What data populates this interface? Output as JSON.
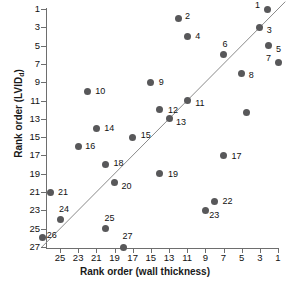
{
  "chart_data": {
    "type": "scatter",
    "title": "",
    "xlabel": "Rank order (wall thickness)",
    "ylabel_text": "Rank order (LVID",
    "ylabel_sub": "d",
    "ylabel_tail": ")",
    "xlim": [
      27,
      0
    ],
    "ylim": [
      0,
      27
    ],
    "x_ticks": [
      25,
      23,
      21,
      19,
      17,
      15,
      13,
      11,
      9,
      7,
      5,
      3,
      1
    ],
    "y_ticks": [
      1,
      3,
      5,
      7,
      9,
      11,
      13,
      15,
      17,
      19,
      21,
      23,
      25,
      27
    ],
    "x_axis_reversed": true,
    "y_axis_reversed": true,
    "grid": false,
    "legend": "none",
    "marker_color": "#58585a",
    "axis_color": "#6e6e6e",
    "fit_line": {
      "label": "identity-line",
      "x_start": 27,
      "y_start": 27,
      "x_end": 0.2,
      "y_end": 0.2,
      "color": "#8a8a8a"
    },
    "points": [
      {
        "label": "1",
        "x": 2.2,
        "y": 1.0,
        "lx": -12,
        "ly": -4
      },
      {
        "label": "2",
        "x": 12.0,
        "y": 2.0,
        "lx": 7,
        "ly": -2
      },
      {
        "label": "3",
        "x": 3.0,
        "y": 3.0,
        "lx": 7,
        "ly": 3
      },
      {
        "label": "4",
        "x": 11.0,
        "y": 4.0,
        "lx": 8,
        "ly": 0
      },
      {
        "label": "5",
        "x": 2.0,
        "y": 5.0,
        "lx": 7,
        "ly": 3
      },
      {
        "label": "6",
        "x": 7.0,
        "y": 6.0,
        "lx": -1,
        "ly": -11
      },
      {
        "label": "7",
        "x": 1.0,
        "y": 6.8,
        "lx": -12,
        "ly": -4
      },
      {
        "label": "8",
        "x": 5.0,
        "y": 8.0,
        "lx": 7,
        "ly": 2
      },
      {
        "label": "9",
        "x": 15.0,
        "y": 9.0,
        "lx": 8,
        "ly": 0
      },
      {
        "label": "10",
        "x": 22.0,
        "y": 10.0,
        "lx": 8,
        "ly": 0
      },
      {
        "label": "11",
        "x": 11.0,
        "y": 11.0,
        "lx": 8,
        "ly": 2
      },
      {
        "label": "12",
        "x": 14.0,
        "y": 12.0,
        "lx": 8,
        "ly": 0
      },
      {
        "label": "",
        "x": 4.5,
        "y": 12.3,
        "lx": 0,
        "ly": 0
      },
      {
        "label": "13",
        "x": 13.0,
        "y": 13.0,
        "lx": 7,
        "ly": 3
      },
      {
        "label": "14",
        "x": 21.0,
        "y": 14.0,
        "lx": 8,
        "ly": 0
      },
      {
        "label": "15",
        "x": 17.0,
        "y": 15.0,
        "lx": 8,
        "ly": -2
      },
      {
        "label": "16",
        "x": 23.0,
        "y": 16.0,
        "lx": 7,
        "ly": 0
      },
      {
        "label": "17",
        "x": 7.0,
        "y": 17.0,
        "lx": 8,
        "ly": 1
      },
      {
        "label": "18",
        "x": 20.0,
        "y": 18.0,
        "lx": 8,
        "ly": -2
      },
      {
        "label": "19",
        "x": 14.0,
        "y": 19.0,
        "lx": 8,
        "ly": 0
      },
      {
        "label": "20",
        "x": 19.0,
        "y": 20.0,
        "lx": 7,
        "ly": 3
      },
      {
        "label": "21",
        "x": 26.0,
        "y": 21.0,
        "lx": 7,
        "ly": 0
      },
      {
        "label": "22",
        "x": 8.0,
        "y": 22.0,
        "lx": 8,
        "ly": 0
      },
      {
        "label": "23",
        "x": 9.0,
        "y": 23.0,
        "lx": 4,
        "ly": 5
      },
      {
        "label": "24",
        "x": 25.0,
        "y": 24.0,
        "lx": -1,
        "ly": -11
      },
      {
        "label": "25",
        "x": 20.0,
        "y": 25.0,
        "lx": -1,
        "ly": -11
      },
      {
        "label": "26",
        "x": 26.9,
        "y": 26.0,
        "lx": 4,
        "ly": -3
      },
      {
        "label": "27",
        "x": 18.0,
        "y": 27.0,
        "lx": -1,
        "ly": -11
      }
    ]
  }
}
